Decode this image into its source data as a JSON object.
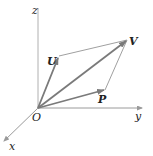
{
  "diagram": {
    "title": "",
    "axes": {
      "x": {
        "label": "x"
      },
      "y": {
        "label": "y"
      },
      "z": {
        "label": "z"
      }
    },
    "points": {
      "origin": {
        "label": "O"
      },
      "U": {
        "label": "U"
      },
      "V": {
        "label": "V"
      },
      "P": {
        "label": "P"
      }
    },
    "colors": {
      "axis": "#9a9a9a",
      "vector": "#7a7a7a",
      "edge": "#a0a0a0",
      "text": "#222222"
    }
  }
}
